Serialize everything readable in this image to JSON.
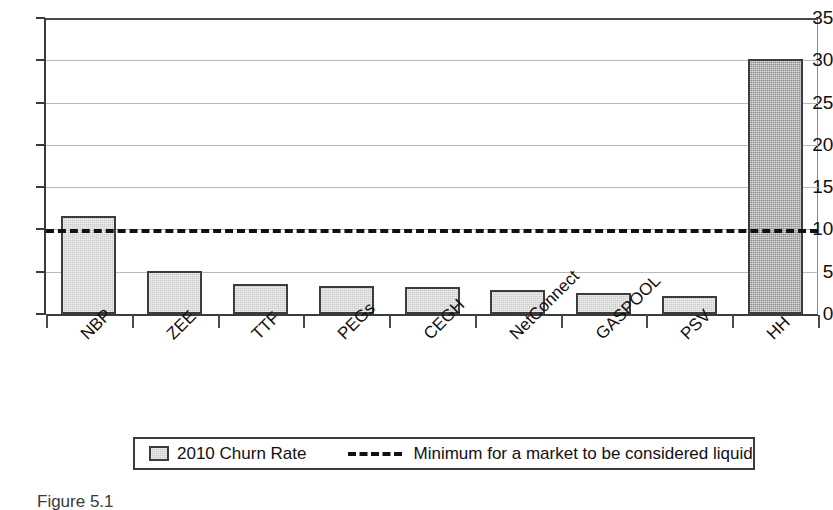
{
  "chart_data": {
    "type": "bar",
    "title": "",
    "xlabel": "",
    "ylabel": "",
    "ylim": [
      0,
      35
    ],
    "yticks": [
      0,
      5,
      10,
      15,
      20,
      25,
      30,
      35
    ],
    "grid": true,
    "categories": [
      "NBP",
      "ZEE",
      "TTF",
      "PEGs",
      "CEGH",
      "NetConnect",
      "GASPOOL",
      "PSV",
      "HH"
    ],
    "series": [
      {
        "name": "2010 Churn Rate",
        "values": [
          11.6,
          5.1,
          3.5,
          3.3,
          3.2,
          2.8,
          2.5,
          2.1,
          30.1
        ]
      }
    ],
    "annotations": [
      {
        "name": "Minimum for a market to be considered liquid",
        "type": "hline",
        "value": 10
      }
    ],
    "legend": {
      "position": "bottom",
      "entries": [
        {
          "label": "2010 Churn Rate",
          "marker": "filled-square",
          "color": "#cbcbcb"
        },
        {
          "label": "Minimum for a market to be considered liquid",
          "marker": "dashed-line",
          "color": "#111111"
        }
      ]
    },
    "colors": {
      "bar_fill": "#cbcbcb",
      "bar_fill_highlight": "#8d8d8d",
      "bar_border": "#3c3c3c",
      "gridline": "#b9b9b9",
      "axis": "#3a3a3a",
      "threshold_line": "#111111"
    }
  },
  "caption": {
    "text": "Figure 5.1"
  }
}
